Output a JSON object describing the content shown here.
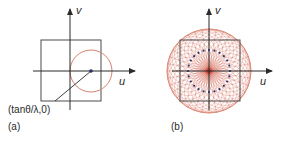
{
  "figure": {
    "panels": [
      {
        "id": "a",
        "panel_label": "(a)",
        "axes": {
          "x_label": "u",
          "y_label": "v"
        },
        "point_label": "(tanθ/λ,0)",
        "elements": [
          "square aperture",
          "circle offset along u",
          "center point"
        ]
      },
      {
        "id": "b",
        "panel_label": "(b)",
        "axes": {
          "x_label": "u",
          "y_label": "v"
        },
        "elements": [
          "square aperture",
          "family of rotated circles through origin",
          "dotted circle of centers"
        ]
      }
    ],
    "colors": {
      "axis": "#2b2b2b",
      "square": "#4a4a4a",
      "circle": "#d9826e",
      "dot": "#27306b",
      "center_glow": "#c0281c"
    }
  }
}
